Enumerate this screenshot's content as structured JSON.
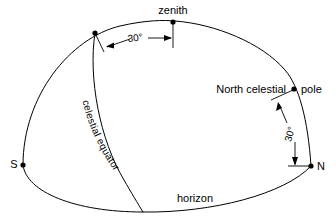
{
  "diagram": {
    "type": "astronomical-diagram",
    "background_color": "#ffffff",
    "line_color": "#000000",
    "labels": {
      "zenith": "zenith",
      "north_celestial": "North celestial",
      "pole": "pole",
      "celestial_equator": "celestial equator",
      "horizon": "horizon",
      "south_point": "S",
      "north_point": "N",
      "angle_top": "30°",
      "angle_right": "30°"
    },
    "points": [
      {
        "name": "zenith",
        "label": "zenith",
        "x": 173,
        "y": 22
      },
      {
        "name": "equator-dome-intersection",
        "label": "",
        "x": 95,
        "y": 33
      },
      {
        "name": "north-celestial-pole",
        "label": "pole",
        "x": 294,
        "y": 89
      },
      {
        "name": "south-point",
        "label": "S",
        "x": 23,
        "y": 165
      },
      {
        "name": "north-point",
        "label": "N",
        "x": 311,
        "y": 166
      }
    ],
    "angles": [
      {
        "name": "zenith-to-equator-angle",
        "value": "30°",
        "between": [
          "zenith",
          "equator-dome-intersection"
        ]
      },
      {
        "name": "pole-to-north-angle",
        "value": "30°",
        "between": [
          "north-celestial-pole",
          "north-point"
        ]
      }
    ],
    "curves": [
      {
        "name": "meridian-dome",
        "label": ""
      },
      {
        "name": "horizon-ellipse",
        "label": "horizon"
      },
      {
        "name": "celestial-equator-arc",
        "label": "celestial equator"
      }
    ]
  }
}
